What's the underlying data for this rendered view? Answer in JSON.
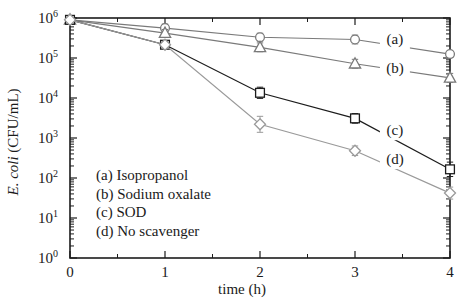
{
  "chart_data": {
    "type": "line",
    "title": "",
    "xlabel": "time (h)",
    "ylabel": "E. coli (CFU/mL)",
    "ylabel_italic_part": "E. coli",
    "ylabel_rest_part": " (CFU/mL)",
    "x": [
      0,
      1,
      2,
      3,
      4
    ],
    "xlim": [
      0,
      4
    ],
    "ylim": [
      1,
      1000000
    ],
    "yscale": "log",
    "xticks": [
      "0",
      "1",
      "2",
      "3",
      "4"
    ],
    "yticks": [
      "10",
      "10",
      "10",
      "10",
      "10",
      "10",
      "10"
    ],
    "ytick_exponents": [
      "0",
      "1",
      "2",
      "3",
      "4",
      "5",
      "6"
    ],
    "ytick_values": [
      1,
      10,
      100,
      1000,
      10000,
      100000,
      1000000
    ],
    "grid": false,
    "legend_position": "lower-left-inside",
    "series": [
      {
        "key": "a",
        "name": "Isopropanol",
        "label": "(a)",
        "marker": "circle",
        "color": "#7a7a7a",
        "values": [
          900000,
          560000,
          330000,
          290000,
          125000
        ],
        "log_values": [
          5.954,
          5.748,
          5.519,
          5.462,
          5.097
        ],
        "err_lo": [
          0.05,
          0.1,
          0.1,
          0.11,
          0.07
        ],
        "err_hi": [
          0.05,
          0.1,
          0.1,
          0.11,
          0.07
        ],
        "label_x": 3.42,
        "label_log_y": 5.35
      },
      {
        "key": "b",
        "name": "Sodium oxalate",
        "label": "(b)",
        "marker": "triangle",
        "color": "#7a7a7a",
        "values": [
          900000,
          420000,
          185000,
          72000,
          32000
        ],
        "log_values": [
          5.954,
          5.623,
          5.267,
          4.857,
          4.505
        ],
        "err_lo": [
          0.05,
          0.09,
          0.11,
          0.11,
          0.11
        ],
        "err_hi": [
          0.05,
          0.09,
          0.11,
          0.11,
          0.11
        ],
        "label_x": 3.42,
        "label_log_y": 4.63
      },
      {
        "key": "c",
        "name": "SOD",
        "label": "(c)",
        "marker": "square",
        "color": "#1c1c1c",
        "values": [
          900000,
          215000,
          13500,
          3100,
          165
        ],
        "log_values": [
          5.954,
          5.332,
          4.13,
          3.491,
          2.217
        ],
        "err_lo": [
          0.05,
          0.08,
          0.14,
          0.12,
          0.18
        ],
        "err_hi": [
          0.05,
          0.08,
          0.14,
          0.12,
          0.18
        ],
        "label_x": 3.42,
        "label_log_y": 3.07
      },
      {
        "key": "d",
        "name": "No scavenger",
        "label": "(d)",
        "marker": "diamond",
        "color": "#9a9a9a",
        "values": [
          900000,
          215000,
          2200,
          480,
          42
        ],
        "log_values": [
          5.954,
          5.332,
          3.342,
          2.681,
          1.623
        ],
        "err_lo": [
          0.05,
          0.08,
          0.2,
          0.12,
          0.15
        ],
        "err_hi": [
          0.05,
          0.08,
          0.2,
          0.12,
          0.15
        ],
        "label_x": 3.42,
        "label_log_y": 2.35
      }
    ],
    "legend_entries": [
      "(a) Isopropanol",
      "(b) Sodium oxalate",
      "(c) SOD",
      "(d) No scavenger"
    ]
  }
}
